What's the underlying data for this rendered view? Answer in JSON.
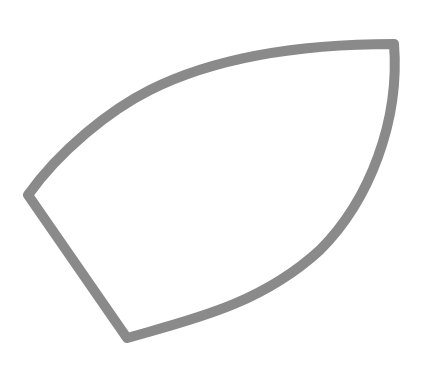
{
  "drawing": {
    "shape": "iron-soleplate-outline",
    "stroke_color": "#8a8a8a",
    "fill_color": "#ffffff",
    "stroke_width": 10,
    "vertices": {
      "left_corner": [
        28,
        195
      ],
      "bottom_corner": [
        127,
        338
      ],
      "top_right_tip": [
        394,
        44
      ]
    }
  }
}
